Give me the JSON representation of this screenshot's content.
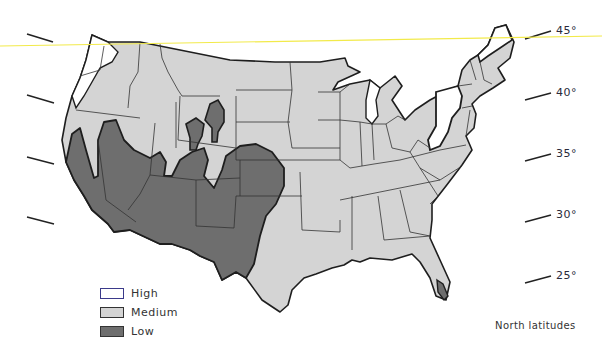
{
  "map": {
    "region": "Contiguous United States",
    "colors": {
      "high": "#ffffff",
      "medium": "#d4d4d4",
      "low": "#6e6e6e",
      "border": "#1e1e1e",
      "high_swatch_border": "#3b3a8a",
      "latitude_line": "#f2ea4a"
    },
    "latitude_labels": [
      {
        "label": "45°",
        "value": 45
      },
      {
        "label": "40°",
        "value": 40
      },
      {
        "label": "35°",
        "value": 35
      },
      {
        "label": "30°",
        "value": 30
      },
      {
        "label": "25°",
        "value": 25
      }
    ],
    "caption": "North latitudes"
  },
  "legend": {
    "items": [
      {
        "key": "high",
        "label": "High"
      },
      {
        "key": "medium",
        "label": "Medium"
      },
      {
        "key": "low",
        "label": "Low"
      }
    ]
  }
}
